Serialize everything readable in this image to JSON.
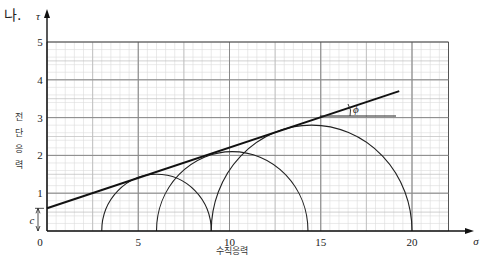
{
  "problem": {
    "label": "나."
  },
  "chart_data": {
    "type": "line",
    "xlabel": "수직응력",
    "ylabel": "전단응력",
    "x_symbol": "σ",
    "y_symbol": "τ",
    "xlim": [
      0,
      22
    ],
    "ylim": [
      0,
      5
    ],
    "x_ticks": [
      0,
      5,
      10,
      15,
      20
    ],
    "y_ticks": [
      1,
      2,
      3,
      4,
      5
    ],
    "grid": true,
    "cohesion_label": "c",
    "cohesion_value": 0.6,
    "friction_angle_label": "ϕ",
    "failure_envelope": {
      "x": [
        0,
        19.3
      ],
      "y": [
        0.6,
        3.7
      ]
    },
    "mohr_circles": [
      {
        "name": "circle-1",
        "sigma3": 3,
        "sigma1": 9,
        "center": 6,
        "radius": 3,
        "peak_tau": 1.5
      },
      {
        "name": "circle-2",
        "sigma3": 6,
        "sigma1": 14.3,
        "center": 10.15,
        "radius": 4.15,
        "peak_tau": 2.1
      },
      {
        "name": "circle-3",
        "sigma3": 9,
        "sigma1": 20,
        "center": 14.5,
        "radius": 5.5,
        "peak_tau": 2.8
      }
    ]
  },
  "axis": {
    "origin_label": "0",
    "x_tick_labels": [
      "5",
      "10",
      "15",
      "20"
    ],
    "y_tick_labels": [
      "1",
      "2",
      "3",
      "4",
      "5"
    ],
    "ylabel_chars": [
      "전",
      "단",
      "응",
      "력"
    ]
  }
}
